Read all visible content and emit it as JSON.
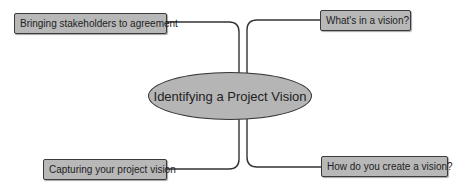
{
  "diagram": {
    "type": "mind-map",
    "center": {
      "label": "Identifying a Project Vision"
    },
    "branches": [
      {
        "id": "top-left",
        "label": "Bringing stakeholders to agreement"
      },
      {
        "id": "top-right",
        "label": "What's in a vision?"
      },
      {
        "id": "bottom-left",
        "label": "Capturing your project vision"
      },
      {
        "id": "bottom-right",
        "label": "How do you create a vision?"
      }
    ],
    "colors": {
      "node_fill": "#b8b8b8",
      "border": "#333333",
      "connector": "#333333"
    }
  }
}
